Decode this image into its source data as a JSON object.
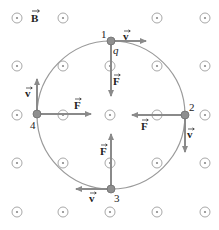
{
  "diagram": {
    "type": "charged particle circular motion in magnetic field",
    "field_label": "B",
    "field_direction": "out of page (dot symbols)",
    "charge_label": "q",
    "velocity_label": "v",
    "force_label": "F",
    "colors": {
      "arrow": "#8a8a8a",
      "circle": "#9a9a9a",
      "field_symbol": "#a8a8a8",
      "point": "#888888",
      "text": "#222222"
    },
    "points": [
      {
        "id": "1",
        "label": "1",
        "velocity": "right",
        "force": "down"
      },
      {
        "id": "2",
        "label": "2",
        "velocity": "down",
        "force": "left"
      },
      {
        "id": "3",
        "label": "3",
        "velocity": "left",
        "force": "up"
      },
      {
        "id": "4",
        "label": "4",
        "velocity": "up",
        "force": "right"
      }
    ],
    "grid": {
      "columns": 5,
      "rows": 5
    }
  }
}
